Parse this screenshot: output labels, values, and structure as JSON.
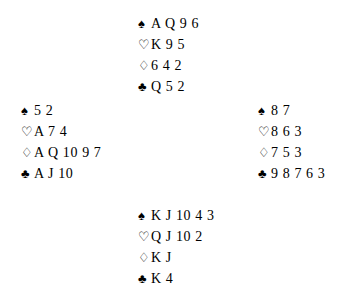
{
  "diagram": {
    "type": "bridge-deal",
    "background_color": "#ffffff",
    "text_color": "#000000",
    "suit_glyphs": {
      "spades": "♠",
      "hearts": "♡",
      "diamonds": "♢",
      "clubs": "♣"
    },
    "suit_fill": {
      "spades": "solid",
      "hearts": "hollow",
      "diamonds": "hollow",
      "clubs": "solid"
    },
    "hands": {
      "north": {
        "position": "north",
        "spades": "A Q 9 6",
        "hearts": "K 9 5",
        "diamonds": "6 4 2",
        "clubs": "Q 5 2"
      },
      "west": {
        "position": "west",
        "spades": "5 2",
        "hearts": "A 7 4",
        "diamonds": "A Q 10 9 7",
        "clubs": "A J 10"
      },
      "east": {
        "position": "east",
        "spades": "8 7",
        "hearts": "8 6 3",
        "diamonds": "7 5 3",
        "clubs": "9 8 7 6 3"
      },
      "south": {
        "position": "south",
        "spades": "K J 10 4 3",
        "hearts": "Q J 10 2",
        "diamonds": "K J",
        "clubs": "K 4"
      }
    }
  }
}
